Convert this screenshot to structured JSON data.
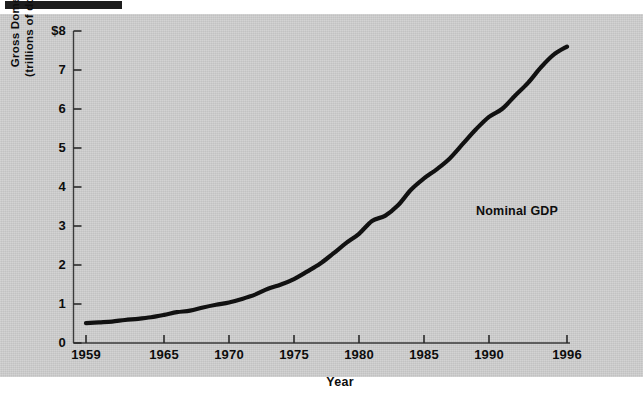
{
  "figure": {
    "background_color": "#cfcfcf",
    "line_color": "#111111",
    "top_rule_color": "#1d1d1d",
    "annotation": "Nominal GDP",
    "xlabel": "Year",
    "ylabel_line1": "Gross Domestic Product",
    "ylabel_line2": "(trillions of dollars per year)"
  },
  "chart_data": {
    "type": "line",
    "title": "",
    "xlabel": "Year",
    "ylabel": "Gross Domestic Product (trillions of dollars per year)",
    "xlim": [
      1959,
      1996
    ],
    "ylim": [
      0,
      8
    ],
    "xticks": [
      1959,
      1965,
      1970,
      1975,
      1980,
      1985,
      1990,
      1996
    ],
    "xticklabels": [
      "1959",
      "1965",
      "1970",
      "1975",
      "1980",
      "1985",
      "1990",
      "1996"
    ],
    "yticks": [
      0,
      1,
      2,
      3,
      4,
      5,
      6,
      7,
      8
    ],
    "yticklabels": [
      "0",
      "1",
      "2",
      "3",
      "4",
      "5",
      "6",
      "7",
      "$8"
    ],
    "grid": false,
    "legend": null,
    "annotations": [
      {
        "text": "Nominal GDP",
        "x": 1987.5,
        "y": 3.45
      }
    ],
    "series": [
      {
        "name": "Nominal GDP",
        "color": "#111111",
        "x": [
          1959,
          1960,
          1961,
          1962,
          1963,
          1964,
          1965,
          1966,
          1967,
          1968,
          1969,
          1970,
          1971,
          1972,
          1973,
          1974,
          1975,
          1976,
          1977,
          1978,
          1979,
          1980,
          1981,
          1982,
          1983,
          1984,
          1985,
          1986,
          1987,
          1988,
          1989,
          1990,
          1991,
          1992,
          1993,
          1994,
          1995,
          1996
        ],
        "values": [
          0.51,
          0.53,
          0.55,
          0.59,
          0.62,
          0.66,
          0.72,
          0.79,
          0.83,
          0.91,
          0.98,
          1.04,
          1.13,
          1.24,
          1.39,
          1.5,
          1.64,
          1.83,
          2.03,
          2.29,
          2.56,
          2.8,
          3.13,
          3.26,
          3.53,
          3.93,
          4.22,
          4.46,
          4.74,
          5.11,
          5.48,
          5.8,
          6.0,
          6.34,
          6.67,
          7.07,
          7.4,
          7.6
        ],
        "units": "trillions of dollars per year"
      }
    ]
  },
  "axis_geometry": {
    "x_pixel_1959": 86,
    "x_pixel_1996": 567,
    "y_pixel_0": 343,
    "y_pixel_8": 31
  }
}
